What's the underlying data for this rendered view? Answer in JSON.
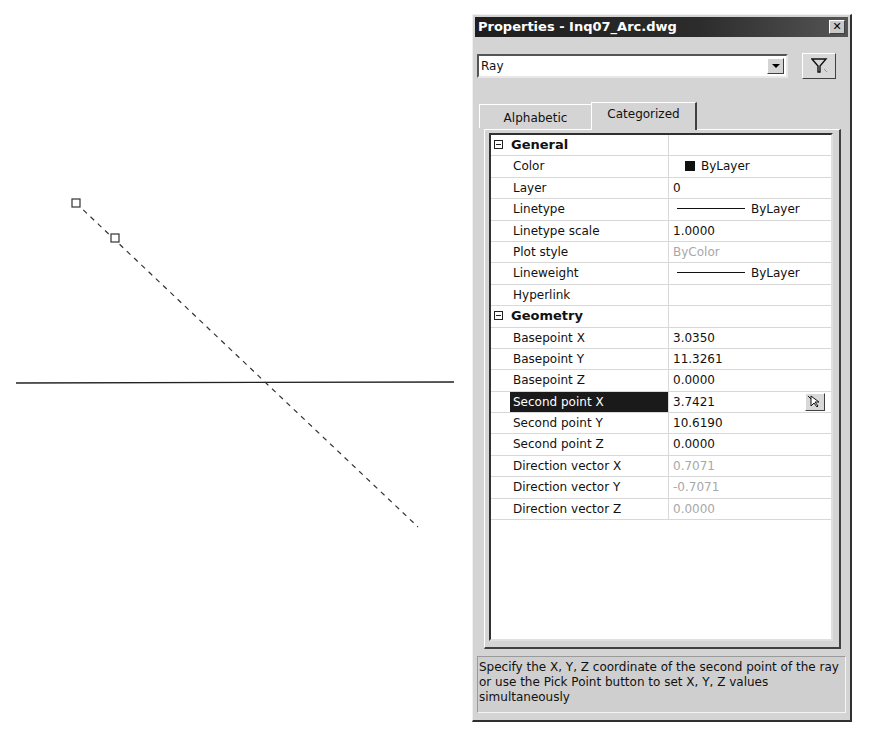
{
  "window": {
    "title": "Properties - Inq07_Arc.dwg",
    "close_glyph": "✕"
  },
  "selector": {
    "value": "Ray",
    "filter_icon": "quick-select-funnel-icon"
  },
  "tabs": [
    {
      "label": "Alphabetic",
      "active": false
    },
    {
      "label": "Categorized",
      "active": true
    }
  ],
  "categories": [
    {
      "name": "General",
      "rows": [
        {
          "label": "Color",
          "value": "ByLayer",
          "kind": "color",
          "swatch": "#111111"
        },
        {
          "label": "Layer",
          "value": "0"
        },
        {
          "label": "Linetype",
          "value": "ByLayer",
          "kind": "line"
        },
        {
          "label": "Linetype scale",
          "value": "1.0000"
        },
        {
          "label": "Plot style",
          "value": "ByColor",
          "dim": true
        },
        {
          "label": "Lineweight",
          "value": "ByLayer",
          "kind": "line"
        },
        {
          "label": "Hyperlink",
          "value": ""
        }
      ]
    },
    {
      "name": "Geometry",
      "rows": [
        {
          "label": "Basepoint X",
          "value": "3.0350"
        },
        {
          "label": "Basepoint Y",
          "value": "11.3261"
        },
        {
          "label": "Basepoint Z",
          "value": "0.0000"
        },
        {
          "label": "Second point X",
          "value": "3.7421",
          "selected": true
        },
        {
          "label": "Second point Y",
          "value": "10.6190"
        },
        {
          "label": "Second point Z",
          "value": "0.0000"
        },
        {
          "label": "Direction vector X",
          "value": "0.7071",
          "dim": true
        },
        {
          "label": "Direction vector Y",
          "value": "-0.7071",
          "dim": true
        },
        {
          "label": "Direction vector Z",
          "value": "0.0000",
          "dim": true
        }
      ]
    }
  ],
  "description": "Specify the X, Y, Z coordinate of the second point of the ray or use the Pick Point button to set X, Y, Z values simultaneously",
  "drawing": {
    "horizontal_line": {
      "x1": 16,
      "y1": 383,
      "x2": 454,
      "y2": 382
    },
    "ray": {
      "x1": 76,
      "y1": 203,
      "x2": 418,
      "y2": 527
    },
    "grips": [
      {
        "x": 76,
        "y": 203
      },
      {
        "x": 115,
        "y": 238
      }
    ]
  }
}
